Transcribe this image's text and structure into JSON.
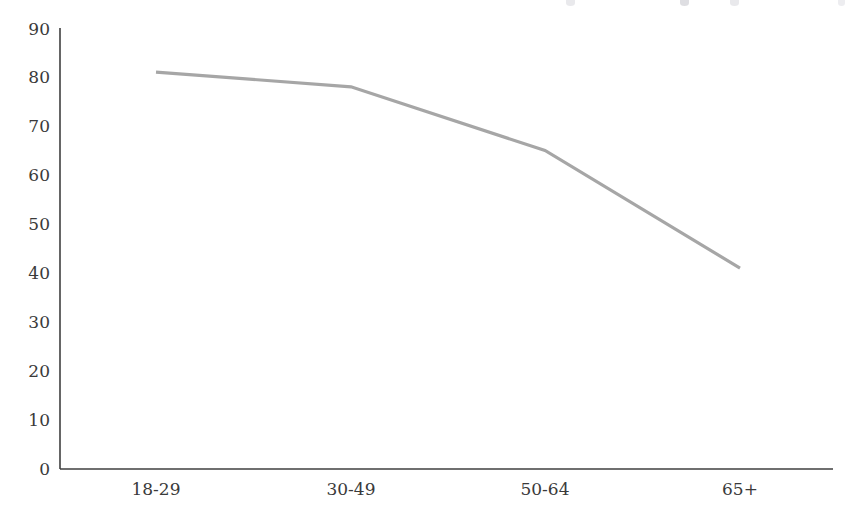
{
  "chart_data": {
    "type": "line",
    "title": "",
    "xlabel": "",
    "ylabel": "",
    "categories": [
      "18-29",
      "30-49",
      "50-64",
      "65+"
    ],
    "values": [
      81,
      78,
      65,
      41
    ],
    "series": [
      {
        "name": "",
        "values": [
          81,
          78,
          65,
          41
        ],
        "color": "#a6a6a6"
      }
    ],
    "ylim": [
      0,
      90
    ],
    "yticks": [
      0,
      10,
      20,
      30,
      40,
      50,
      60,
      70,
      80,
      90
    ],
    "ytick_labels": [
      "0",
      "10",
      "20",
      "30",
      "40",
      "50",
      "60",
      "70",
      "80",
      "90"
    ],
    "xtick_labels": [
      "18-29",
      "30-49",
      "50-64",
      "65+"
    ],
    "grid": false,
    "legend": "none",
    "axis_color": "#3f3f3f",
    "text_color": "#3a3a3a",
    "background": "#ffffff"
  },
  "axes": {
    "y_axis_name": "value-axis",
    "x_axis_name": "category-axis"
  }
}
